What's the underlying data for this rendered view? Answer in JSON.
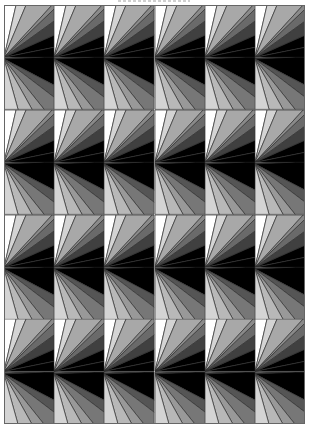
{
  "pattern": {
    "columns": 6,
    "rows": 8,
    "tile_types": [
      "fan-up",
      "fan-down"
    ],
    "fan_up": {
      "top_points": [
        12,
        22,
        48
      ],
      "right_points": [
        16,
        30,
        42
      ],
      "colors": [
        "#ffffff",
        "#d4d4d4",
        "#a8a8a8",
        "#8a8a8a",
        "#6a6a6a",
        "#404040",
        "#000000"
      ]
    },
    "fan_down": {
      "top_points": [
        22,
        31,
        40
      ],
      "right_points": [
        28,
        40
      ],
      "bottom_points": [
        40,
        28,
        14
      ],
      "colors": [
        "#6a6a6a",
        "#4a4a4a",
        "#2e2e2e",
        "#000000",
        "#555555",
        "#777777",
        "#999999",
        "#b8b8b8",
        "#d4d4d4",
        "#ffffff"
      ]
    },
    "stroke": "#333333"
  }
}
